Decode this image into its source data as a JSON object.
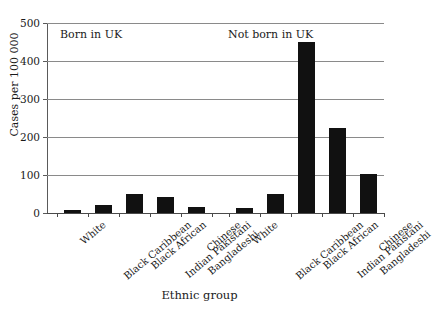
{
  "chart_data": {
    "type": "bar",
    "title": "",
    "xlabel": "Ethnic group",
    "ylabel": "Cases per 100 000",
    "ylim": [
      0,
      500
    ],
    "yticks": [
      0,
      100,
      200,
      300,
      400,
      500
    ],
    "grid": true,
    "legend_position": "none",
    "categories": [
      "White",
      "Black Caribbean",
      "Black African",
      "Indian Pakistani Bangladeshi",
      "Chinese"
    ],
    "category_lines": [
      [
        "White"
      ],
      [
        "Black Caribbean"
      ],
      [
        "Black African"
      ],
      [
        "Indian Pakistani",
        "Bangladeshi"
      ],
      [
        "Chinese"
      ]
    ],
    "series": [
      {
        "name": "Born in UK",
        "values": [
          8,
          20,
          50,
          42,
          15
        ]
      },
      {
        "name": "Not born in UK",
        "values": [
          12,
          50,
          450,
          225,
          103
        ]
      }
    ],
    "annotations": [
      {
        "text": "Born in UK"
      },
      {
        "text": "Not born in UK"
      }
    ],
    "bar_color": "#111111",
    "grid_color": "#8a8a8a",
    "axis_color": "#4a4a4a"
  },
  "axis": {
    "y_title": "Cases per 100 000",
    "x_title": "Ethnic group",
    "y_tick_labels": [
      "500",
      "400",
      "300",
      "200",
      "100",
      "0"
    ]
  },
  "groups": {
    "left_label": "Born in UK",
    "right_label": "Not born in UK"
  },
  "artifact": {
    "top_fragment": ""
  }
}
